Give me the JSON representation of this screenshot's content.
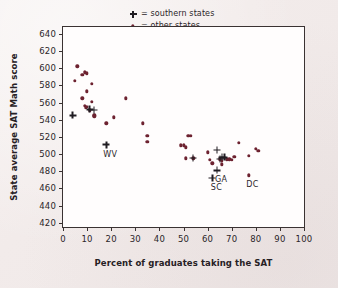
{
  "chart_data": {
    "type": "scatter",
    "title": "",
    "xlabel": "Percent of graduates taking the SAT",
    "ylabel": "State average SAT Math score",
    "xlim": [
      0,
      100
    ],
    "ylim": [
      415,
      648
    ],
    "xticks": [
      0,
      10,
      20,
      30,
      40,
      50,
      60,
      70,
      80,
      90,
      100
    ],
    "yticks": [
      420,
      440,
      460,
      480,
      500,
      520,
      540,
      560,
      580,
      600,
      620,
      640
    ],
    "xtick_labels": [
      "0",
      "10",
      "20",
      "30",
      "40",
      "50",
      "60",
      "70",
      "80",
      "90",
      "100"
    ],
    "ytick_labels": [
      "420",
      "440",
      "460",
      "480",
      "500",
      "520",
      "540",
      "560",
      "580",
      "600",
      "620",
      "640"
    ],
    "grid": false,
    "legend_position": "top-right",
    "marker_color_other": "#6d2230",
    "marker_color_southern": "#201c22",
    "plot_background": "#fffdfd",
    "page_background": "#f2ebea",
    "legend": [
      {
        "marker": "plus-marker",
        "text": "= southern states"
      },
      {
        "marker": "dot-marker",
        "text": "= other states"
      }
    ],
    "series": [
      {
        "name": "other states",
        "marker": "dot",
        "points": [
          [
            5,
            585
          ],
          [
            6,
            602
          ],
          [
            8,
            592
          ],
          [
            9,
            595
          ],
          [
            10,
            594
          ],
          [
            8,
            565
          ],
          [
            10,
            573
          ],
          [
            12,
            582
          ],
          [
            12,
            561
          ],
          [
            9,
            556
          ],
          [
            10,
            555
          ],
          [
            9.5,
            554
          ],
          [
            11,
            551
          ],
          [
            13,
            545
          ],
          [
            13,
            544
          ],
          [
            18,
            536
          ],
          [
            21,
            543
          ],
          [
            26,
            565
          ],
          [
            33,
            536
          ],
          [
            35,
            521
          ],
          [
            35,
            514
          ],
          [
            49,
            510
          ],
          [
            50,
            510
          ],
          [
            51,
            508
          ],
          [
            52,
            521
          ],
          [
            53,
            521
          ],
          [
            51,
            495
          ],
          [
            54,
            495
          ],
          [
            61,
            493
          ],
          [
            62,
            489
          ],
          [
            65,
            494
          ],
          [
            66,
            492
          ],
          [
            66,
            488
          ],
          [
            68,
            494
          ],
          [
            69,
            494
          ],
          [
            70,
            493
          ],
          [
            71,
            497
          ],
          [
            73,
            513
          ],
          [
            77,
            498
          ],
          [
            80,
            506
          ],
          [
            81,
            504
          ],
          [
            60,
            502
          ]
        ]
      },
      {
        "name": "southern states",
        "marker": "plus",
        "points": [
          [
            4,
            545
          ],
          [
            11,
            552
          ],
          [
            13,
            551
          ],
          [
            18,
            511
          ],
          [
            54,
            495
          ],
          [
            62,
            472
          ],
          [
            64,
            505
          ],
          [
            65,
            494
          ],
          [
            66,
            496
          ],
          [
            64,
            481
          ],
          [
            67,
            496
          ]
        ]
      }
    ],
    "annotations": [
      {
        "label": "WV",
        "x": 18,
        "y": 511,
        "marker": "plus"
      },
      {
        "label": "SC",
        "x": 62,
        "y": 472,
        "marker": "plus"
      },
      {
        "label": "GA",
        "x": 64,
        "y": 481,
        "marker": "plus"
      },
      {
        "label": "DC",
        "x": 77,
        "y": 475,
        "marker": "dot"
      }
    ],
    "annotation_points": [
      {
        "label": "DC",
        "x": 77,
        "y": 475,
        "marker": "dot"
      }
    ]
  }
}
